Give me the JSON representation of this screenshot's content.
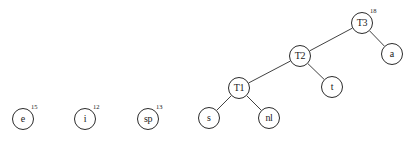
{
  "diagram": {
    "type": "binary-tree-forest",
    "title": "",
    "background_color": "#ffffff",
    "stroke_color": "#2b2b2b",
    "text_color": "#1a1a1a",
    "node_radius": 11,
    "nodes": [
      {
        "id": "e",
        "label": "e",
        "weight": "15",
        "cx": 23,
        "cy": 119,
        "kind": "leaf",
        "isolated": true
      },
      {
        "id": "i",
        "label": "i",
        "weight": "12",
        "cx": 85,
        "cy": 119,
        "kind": "leaf",
        "isolated": true
      },
      {
        "id": "sp",
        "label": "sp",
        "weight": "13",
        "cx": 148,
        "cy": 119,
        "kind": "leaf",
        "isolated": true
      },
      {
        "id": "T3",
        "label": "T3",
        "weight": "18",
        "cx": 362,
        "cy": 23,
        "kind": "internal",
        "isolated": false
      },
      {
        "id": "a",
        "label": "a",
        "weight": "",
        "cx": 392,
        "cy": 54,
        "kind": "leaf",
        "isolated": false
      },
      {
        "id": "T2",
        "label": "T2",
        "weight": "",
        "cx": 300,
        "cy": 56,
        "kind": "internal",
        "isolated": false
      },
      {
        "id": "t",
        "label": "t",
        "weight": "",
        "cx": 332,
        "cy": 87,
        "kind": "leaf",
        "isolated": false
      },
      {
        "id": "T1",
        "label": "T1",
        "weight": "",
        "cx": 239,
        "cy": 88,
        "kind": "internal",
        "isolated": false
      },
      {
        "id": "s",
        "label": "s",
        "weight": "",
        "cx": 209,
        "cy": 118,
        "kind": "leaf",
        "isolated": false
      },
      {
        "id": "nl",
        "label": "nl",
        "weight": "",
        "cx": 269,
        "cy": 118,
        "kind": "leaf",
        "isolated": false
      }
    ],
    "edges": [
      {
        "from": "T3",
        "to": "T2",
        "side": "left"
      },
      {
        "from": "T3",
        "to": "a",
        "side": "right"
      },
      {
        "from": "T2",
        "to": "T1",
        "side": "left"
      },
      {
        "from": "T2",
        "to": "t",
        "side": "right"
      },
      {
        "from": "T1",
        "to": "s",
        "side": "left"
      },
      {
        "from": "T1",
        "to": "nl",
        "side": "right"
      }
    ]
  }
}
